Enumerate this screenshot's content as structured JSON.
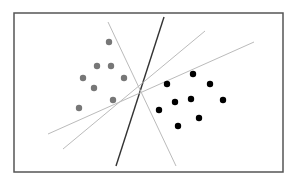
{
  "diagram": {
    "type": "scatter-with-separating-lines",
    "frame": {
      "x": 14,
      "y": 13,
      "width": 269,
      "height": 159,
      "stroke": "#555555"
    },
    "classes": [
      {
        "name": "class-gray",
        "color": "#777777",
        "points": [
          [
            109,
            42
          ],
          [
            97,
            66
          ],
          [
            111,
            66
          ],
          [
            83,
            78
          ],
          [
            124,
            78
          ],
          [
            94,
            88
          ],
          [
            113,
            100
          ],
          [
            79,
            108
          ]
        ]
      },
      {
        "name": "class-black",
        "color": "#000000",
        "points": [
          [
            193,
            74
          ],
          [
            167,
            84
          ],
          [
            210,
            84
          ],
          [
            175,
            102
          ],
          [
            191,
            99
          ],
          [
            223,
            100
          ],
          [
            159,
            110
          ],
          [
            199,
            118
          ],
          [
            178,
            126
          ]
        ]
      }
    ],
    "lines": [
      {
        "name": "separator-optimal",
        "x1": 164,
        "y1": 17,
        "x2": 116,
        "y2": 166,
        "color": "#333333",
        "width": 1.4
      },
      {
        "name": "separator-alt-1",
        "x1": 108,
        "y1": 22,
        "x2": 176,
        "y2": 166,
        "color": "#bbbbbb",
        "width": 1
      },
      {
        "name": "separator-alt-2",
        "x1": 205,
        "y1": 31,
        "x2": 63,
        "y2": 149,
        "color": "#bbbbbb",
        "width": 1
      },
      {
        "name": "separator-alt-3",
        "x1": 254,
        "y1": 42,
        "x2": 48,
        "y2": 134,
        "color": "#bbbbbb",
        "width": 1
      }
    ],
    "point_radius": 3.2
  }
}
